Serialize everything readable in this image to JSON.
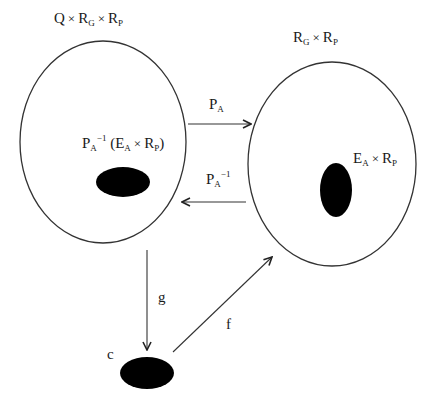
{
  "diagram": {
    "type": "commutative-set-mapping-diagram",
    "colors": {
      "background": "#ffffff",
      "stroke": "#333333",
      "fill_blob": "#000000",
      "text": "#1a1a1a"
    },
    "sets": {
      "left": {
        "label": {
          "parts": [
            "Q",
            "×",
            "R",
            "G",
            "×",
            "R",
            "P"
          ],
          "text": "Q × R_G × R_P"
        },
        "ellipse": {
          "cx": 103,
          "cy": 142,
          "rx": 83,
          "ry": 101
        },
        "inner_region": {
          "label": {
            "P": "P",
            "P_sub": "A",
            "P_sup": "−1",
            "open": "(",
            "E": "E",
            "E_sub": "A",
            "times": "×",
            "R": "R",
            "R_sub": "P",
            "close": ")",
            "text": "P_A^{-1} (E_A × R_P)"
          },
          "blob": {
            "cx": 123,
            "cy": 182,
            "rx": 27,
            "ry": 15
          }
        }
      },
      "right": {
        "label": {
          "parts": [
            "R",
            "G",
            "×",
            "R",
            "P"
          ],
          "text": "R_G × R_P"
        },
        "ellipse": {
          "cx": 332,
          "cy": 164,
          "rx": 84,
          "ry": 102
        },
        "inner_region": {
          "label": {
            "E": "E",
            "E_sub": "A",
            "times": "×",
            "R": "R",
            "R_sub": "P",
            "text": "E_A × R_P"
          },
          "blob": {
            "cx": 336,
            "cy": 190,
            "rx": 16,
            "ry": 27
          }
        }
      },
      "point_c": {
        "label": "c",
        "blob": {
          "cx": 147,
          "cy": 373,
          "rx": 27,
          "ry": 16
        }
      }
    },
    "arrows": [
      {
        "id": "PA",
        "label": {
          "P": "P",
          "sub": "A",
          "text": "P_A"
        },
        "from": [
          188,
          124
        ],
        "to": [
          251,
          124
        ]
      },
      {
        "id": "PA_inv",
        "label": {
          "P": "P",
          "sub": "A",
          "sup": "−1",
          "text": "P_A^{-1}"
        },
        "from": [
          246,
          202
        ],
        "to": [
          182,
          202
        ]
      },
      {
        "id": "g",
        "label": {
          "text": "g"
        },
        "from": [
          147,
          250
        ],
        "to": [
          147,
          350
        ]
      },
      {
        "id": "f",
        "label": {
          "text": "f"
        },
        "from": [
          173,
          352
        ],
        "to": [
          272,
          257
        ]
      }
    ]
  }
}
